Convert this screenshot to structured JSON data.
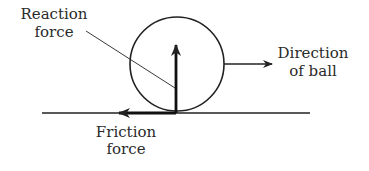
{
  "diagram": {
    "type": "free-body force diagram",
    "labels": {
      "reaction_line1": "Reaction",
      "reaction_line2": "force",
      "direction_line1": "Direction",
      "direction_line2": "of ball",
      "friction_line1": "Friction",
      "friction_line2": "force"
    },
    "elements": {
      "ball": "circle",
      "ground": "horizontal line",
      "reaction_arrow": "vertical arrow pointing up from contact point",
      "friction_arrow": "horizontal arrow pointing left along ground",
      "direction_arrow": "horizontal arrow pointing right from ball"
    },
    "colors": {
      "stroke": "#222222",
      "text": "#2a2a2a",
      "background": "#ffffff"
    }
  }
}
